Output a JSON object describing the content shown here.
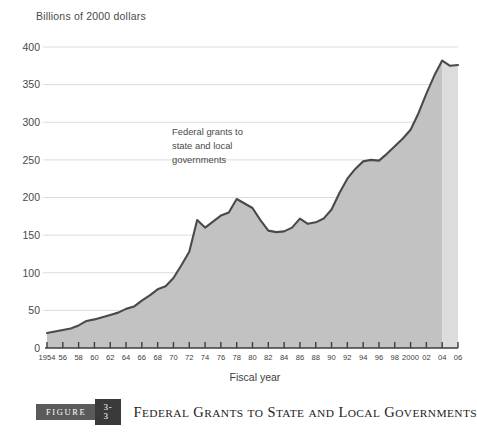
{
  "figure": {
    "y_axis_title": "Billions of 2000 dollars",
    "x_axis_title": "Fiscal year",
    "annotation": {
      "line1": "Federal grants to",
      "line2": "state and local",
      "line3": "governments"
    },
    "caption": {
      "figure_label": "Figure",
      "number": "3-3",
      "title_parts": [
        {
          "big": "F",
          "small": "EDERAL"
        },
        {
          "big": "G",
          "small": "RANTS"
        },
        {
          "big": "",
          "small": "TO"
        },
        {
          "big": "S",
          "small": "TATE"
        },
        {
          "big": "",
          "small": "AND"
        },
        {
          "big": "L",
          "small": "OCAL"
        },
        {
          "big": "G",
          "small": "OVERNMENTS"
        }
      ],
      "title_plain": "Federal Grants to State and Local Governments"
    },
    "colors": {
      "area_fill": "#c2c2c2",
      "area_fill_projected": "#dcdcdc",
      "line": "#4a4a4a",
      "gridline": "#d8d8d8",
      "axis": "#3d3d3d",
      "text": "#4a4a4a",
      "caption_figure_bg": "#5a5a5a",
      "caption_number_bg": "#3a3a3a"
    }
  },
  "chart_data": {
    "type": "area",
    "title": "Federal Grants to State and Local Governments",
    "subtitle": "",
    "xlabel": "Fiscal year",
    "ylabel": "Billions of 2000 dollars",
    "xlim": [
      1954,
      2006
    ],
    "ylim": [
      0,
      400
    ],
    "ytick_values": [
      0,
      50,
      100,
      150,
      200,
      250,
      300,
      350,
      400
    ],
    "ytick_labels": [
      "0",
      "50",
      "100",
      "150",
      "200",
      "250",
      "300",
      "350",
      "400"
    ],
    "xtick_values": [
      1954,
      1956,
      1958,
      1960,
      1962,
      1964,
      1966,
      1968,
      1970,
      1972,
      1974,
      1976,
      1978,
      1980,
      1982,
      1984,
      1986,
      1988,
      1990,
      1992,
      1994,
      1996,
      1998,
      2000,
      2002,
      2004,
      2006
    ],
    "xtick_labels": [
      "1954",
      "56",
      "58",
      "60",
      "62",
      "64",
      "66",
      "68",
      "70",
      "72",
      "74",
      "76",
      "78",
      "80",
      "82",
      "84",
      "86",
      "88",
      "90",
      "92",
      "94",
      "96",
      "98",
      "2000",
      "02",
      "04",
      "06"
    ],
    "grid": "horizontal",
    "legend": "none",
    "annotations": [
      {
        "text": "Federal grants to state and local governments",
        "x": 1972,
        "y": 300
      }
    ],
    "projection_start_year": 2004,
    "series": [
      {
        "name": "Federal grants to state and local governments",
        "x": [
          1954,
          1955,
          1956,
          1957,
          1958,
          1959,
          1960,
          1961,
          1962,
          1963,
          1964,
          1965,
          1966,
          1967,
          1968,
          1969,
          1970,
          1971,
          1972,
          1973,
          1974,
          1975,
          1976,
          1977,
          1978,
          1979,
          1980,
          1981,
          1982,
          1983,
          1984,
          1985,
          1986,
          1987,
          1988,
          1989,
          1990,
          1991,
          1992,
          1993,
          1994,
          1995,
          1996,
          1997,
          1998,
          1999,
          2000,
          2001,
          2002,
          2003,
          2004,
          2005,
          2006
        ],
        "values": [
          20,
          22,
          24,
          26,
          30,
          36,
          38,
          41,
          44,
          47,
          52,
          55,
          63,
          70,
          78,
          82,
          93,
          110,
          128,
          170,
          160,
          168,
          176,
          180,
          198,
          192,
          186,
          170,
          156,
          154,
          155,
          160,
          172,
          165,
          167,
          172,
          184,
          206,
          225,
          238,
          248,
          250,
          249,
          258,
          268,
          278,
          290,
          312,
          338,
          362,
          382,
          375,
          376
        ]
      }
    ]
  }
}
